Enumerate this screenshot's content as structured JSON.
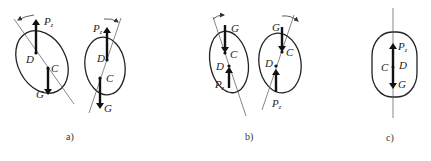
{
  "figures": [
    {
      "id": "a",
      "caption": "a)",
      "panels": [
        {
          "labels": {
            "P": "P",
            "P_sub": "z",
            "D": "D",
            "C": "C",
            "G": "G"
          },
          "rotation": "counterclockwise"
        },
        {
          "labels": {
            "P": "P",
            "P_sub": "z",
            "D": "D",
            "C": "C",
            "G": "G"
          },
          "rotation": "clockwise"
        }
      ]
    },
    {
      "id": "b",
      "caption": "b)",
      "panels": [
        {
          "labels": {
            "P": "P",
            "P_sub": "z",
            "D": "D",
            "C": "C",
            "G": "G"
          },
          "rotation": "counterclockwise"
        },
        {
          "labels": {
            "P": "P",
            "P_sub": "z",
            "D": "D",
            "C": "C",
            "G": "G"
          },
          "rotation": "clockwise"
        }
      ]
    },
    {
      "id": "c",
      "caption": "c)",
      "panels": [
        {
          "labels": {
            "P": "P",
            "P_sub": "z",
            "D": "D",
            "C": "C",
            "G": "G"
          },
          "rotation": "none"
        }
      ]
    }
  ]
}
